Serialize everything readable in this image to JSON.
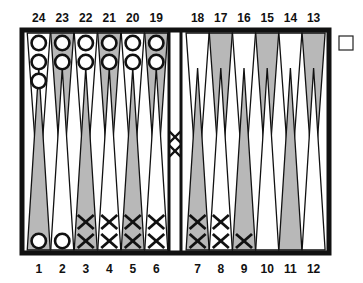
{
  "game": "backgammon",
  "colors": {
    "frame": "#111111",
    "shaded": "#b8b8b8",
    "light": "#ffffff"
  },
  "top_labels": [
    "24",
    "23",
    "22",
    "21",
    "20",
    "19",
    "18",
    "17",
    "16",
    "15",
    "14",
    "13"
  ],
  "bottom_labels": [
    "1",
    "2",
    "3",
    "4",
    "5",
    "6",
    "7",
    "8",
    "9",
    "10",
    "11",
    "12"
  ],
  "points": {
    "1": {
      "player": "O",
      "count": 1
    },
    "2": {
      "player": "O",
      "count": 1
    },
    "3": {
      "player": "X",
      "count": 2
    },
    "4": {
      "player": "X",
      "count": 2
    },
    "5": {
      "player": "X",
      "count": 2
    },
    "6": {
      "player": "X",
      "count": 2
    },
    "7": {
      "player": "X",
      "count": 2
    },
    "8": {
      "player": "X",
      "count": 2
    },
    "9": {
      "player": "X",
      "count": 1
    },
    "10": {
      "player": "",
      "count": 0
    },
    "11": {
      "player": "",
      "count": 0
    },
    "12": {
      "player": "",
      "count": 0
    },
    "13": {
      "player": "",
      "count": 0
    },
    "14": {
      "player": "",
      "count": 0
    },
    "15": {
      "player": "",
      "count": 0
    },
    "16": {
      "player": "",
      "count": 0
    },
    "17": {
      "player": "",
      "count": 0
    },
    "18": {
      "player": "",
      "count": 0
    },
    "19": {
      "player": "O",
      "count": 2
    },
    "20": {
      "player": "O",
      "count": 2
    },
    "21": {
      "player": "O",
      "count": 2
    },
    "22": {
      "player": "O",
      "count": 2
    },
    "23": {
      "player": "O",
      "count": 2
    },
    "24": {
      "player": "O",
      "count": 3
    }
  },
  "bar": {
    "player": "X",
    "count": 2
  },
  "doubling_cube": {
    "value": ""
  }
}
